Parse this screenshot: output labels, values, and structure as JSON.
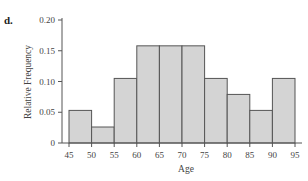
{
  "panel_label": "d.",
  "chart_data": {
    "type": "bar",
    "title": "",
    "xlabel": "Age",
    "ylabel": "Relative Frequency",
    "bin_edges": [
      45,
      50,
      55,
      60,
      65,
      70,
      75,
      80,
      85,
      90,
      95
    ],
    "categories": [
      "45-50",
      "50-55",
      "55-60",
      "60-65",
      "65-70",
      "70-75",
      "75-80",
      "80-85",
      "85-90",
      "90-95"
    ],
    "values": [
      0.053,
      0.026,
      0.105,
      0.158,
      0.158,
      0.158,
      0.105,
      0.079,
      0.053,
      0.105
    ],
    "xlim": [
      45,
      95
    ],
    "ylim": [
      0,
      0.2
    ],
    "xticks": [
      "45",
      "50",
      "55",
      "60",
      "65",
      "70",
      "75",
      "80",
      "85",
      "90",
      "95"
    ],
    "yticks": [
      "0",
      "0.05",
      "0.10",
      "0.15",
      "0.20"
    ],
    "ytick_values": [
      0,
      0.05,
      0.1,
      0.15,
      0.2
    ],
    "grid": false,
    "legend": null
  }
}
